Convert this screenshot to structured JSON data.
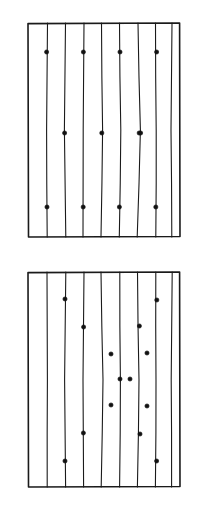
{
  "document": {
    "title": "Two-panel grid of parallel lines with marked points",
    "background_color": "#ffffff",
    "width": 199,
    "height": 515,
    "medium": "scanned line drawing",
    "ink_color": "#1a1a1a",
    "dot_color": "#111111"
  },
  "panels": [
    {
      "id": "panel-top",
      "label": "Top panel",
      "frame": {
        "x": 28,
        "y": 23,
        "width": 152,
        "height": 214
      },
      "frame_stroke_width": 1.6,
      "line_count": 8,
      "line_stroke_width": 1.1,
      "lines": [
        {
          "id": "line-1",
          "x_top": 47.5,
          "x_mid": 46.6,
          "x_bottom": 47.2
        },
        {
          "id": "line-2",
          "x_top": 65.5,
          "x_mid": 64.4,
          "x_bottom": 65.8
        },
        {
          "id": "line-3",
          "x_top": 84.0,
          "x_mid": 83.2,
          "x_bottom": 83.0
        },
        {
          "id": "line-4",
          "x_top": 101.5,
          "x_mid": 102.6,
          "x_bottom": 101.0
        },
        {
          "id": "line-5",
          "x_top": 119.5,
          "x_mid": 120.8,
          "x_bottom": 119.3
        },
        {
          "id": "line-6",
          "x_top": 138.0,
          "x_mid": 140.4,
          "x_bottom": 137.2
        },
        {
          "id": "line-7",
          "x_top": 155.5,
          "x_mid": 156.2,
          "x_bottom": 155.8
        },
        {
          "id": "line-8",
          "x_top": 172.0,
          "x_mid": 171.0,
          "x_bottom": 171.8
        }
      ],
      "dot_rows": [
        {
          "id": "row-upper",
          "y": 52,
          "dots": [
            {
              "x": 46.6,
              "y": 52
            },
            {
              "x": 83.4,
              "y": 52
            },
            {
              "x": 120.0,
              "y": 52
            },
            {
              "x": 156.6,
              "y": 52
            }
          ]
        },
        {
          "id": "row-middle",
          "y": 133,
          "dots": [
            {
              "x": 64.6,
              "y": 133
            },
            {
              "x": 101.8,
              "y": 133
            },
            {
              "x": 139.2,
              "y": 133
            },
            {
              "x": 140.6,
              "y": 133
            }
          ]
        },
        {
          "id": "row-lower",
          "y": 207,
          "dots": [
            {
              "x": 47.0,
              "y": 207
            },
            {
              "x": 83.2,
              "y": 207
            },
            {
              "x": 119.4,
              "y": 207
            },
            {
              "x": 155.8,
              "y": 207
            }
          ]
        }
      ],
      "dot_radius": 2.1,
      "dot_count": 12
    },
    {
      "id": "panel-bottom",
      "label": "Bottom panel",
      "frame": {
        "x": 28,
        "y": 272,
        "width": 152,
        "height": 215
      },
      "frame_stroke_width": 1.6,
      "line_count": 8,
      "line_stroke_width": 1.1,
      "lines": [
        {
          "id": "line-1",
          "x_top": 47.0,
          "x_mid": 47.4,
          "x_bottom": 47.2
        },
        {
          "id": "line-2",
          "x_top": 65.8,
          "x_mid": 64.6,
          "x_bottom": 65.6
        },
        {
          "id": "line-3",
          "x_top": 84.0,
          "x_mid": 83.0,
          "x_bottom": 83.6
        },
        {
          "id": "line-4",
          "x_top": 101.0,
          "x_mid": 103.0,
          "x_bottom": 101.2
        },
        {
          "id": "line-5",
          "x_top": 119.8,
          "x_mid": 120.4,
          "x_bottom": 119.6
        },
        {
          "id": "line-6",
          "x_top": 137.5,
          "x_mid": 139.0,
          "x_bottom": 137.4
        },
        {
          "id": "line-7",
          "x_top": 155.8,
          "x_mid": 156.0,
          "x_bottom": 155.4
        },
        {
          "id": "line-8",
          "x_top": 172.2,
          "x_mid": 171.2,
          "x_bottom": 171.6
        }
      ],
      "dots": [
        {
          "id": "dot-1",
          "x": 65.0,
          "y": 299
        },
        {
          "id": "dot-2",
          "x": 156.8,
          "y": 300
        },
        {
          "id": "dot-3",
          "x": 83.6,
          "y": 327
        },
        {
          "id": "dot-4",
          "x": 139.4,
          "y": 326
        },
        {
          "id": "dot-5",
          "x": 111.0,
          "y": 354
        },
        {
          "id": "dot-6",
          "x": 147.0,
          "y": 353
        },
        {
          "id": "dot-7",
          "x": 130.0,
          "y": 379
        },
        {
          "id": "dot-8",
          "x": 111.0,
          "y": 405
        },
        {
          "id": "dot-9",
          "x": 147.0,
          "y": 406
        },
        {
          "id": "dot-10",
          "x": 83.4,
          "y": 433
        },
        {
          "id": "dot-11",
          "x": 140.0,
          "y": 434
        },
        {
          "id": "dot-12",
          "x": 65.0,
          "y": 461
        },
        {
          "id": "dot-13",
          "x": 156.6,
          "y": 461
        },
        {
          "id": "dot-14",
          "x": 120.0,
          "y": 379
        }
      ],
      "dot_radius": 2.1,
      "dot_count": 14
    }
  ]
}
